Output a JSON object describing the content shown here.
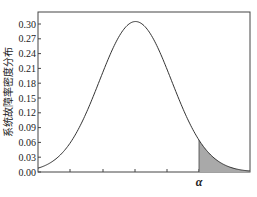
{
  "chart_data": {
    "type": "area",
    "title": "",
    "xlabel": "",
    "ylabel": "系统故障率密度分布",
    "ylim": [
      0.0,
      0.3
    ],
    "yticks": [
      "0.00",
      "0.03",
      "0.06",
      "0.09",
      "0.12",
      "0.15",
      "0.18",
      "0.21",
      "0.24",
      "0.27",
      "0.30"
    ],
    "xticks_count": 5,
    "annotation": "α",
    "curve": {
      "shape": "normal",
      "peak_value": 0.305,
      "peak_position": 0.46,
      "sigma": 0.17
    },
    "shaded_region": {
      "from": "α",
      "to": "right edge",
      "color": "#a9a9a9"
    },
    "grid": false,
    "legend": null
  },
  "colors": {
    "curve": "#333333",
    "fill": "#a9a9a9",
    "frame": "#444444"
  }
}
